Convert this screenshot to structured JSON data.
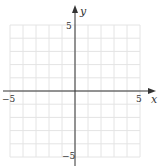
{
  "diagram": {
    "type": "coordinate-grid",
    "x_axis": {
      "label": "x",
      "min": -5,
      "max": 5,
      "tick_labels": [
        "−5",
        "5"
      ]
    },
    "y_axis": {
      "label": "y",
      "min": -5,
      "max": 5,
      "tick_labels": [
        "5",
        "−5"
      ]
    },
    "grid": {
      "cells_x": 10,
      "cells_y": 10,
      "color": "#e4e4e4"
    },
    "axis_color": "#333333"
  }
}
